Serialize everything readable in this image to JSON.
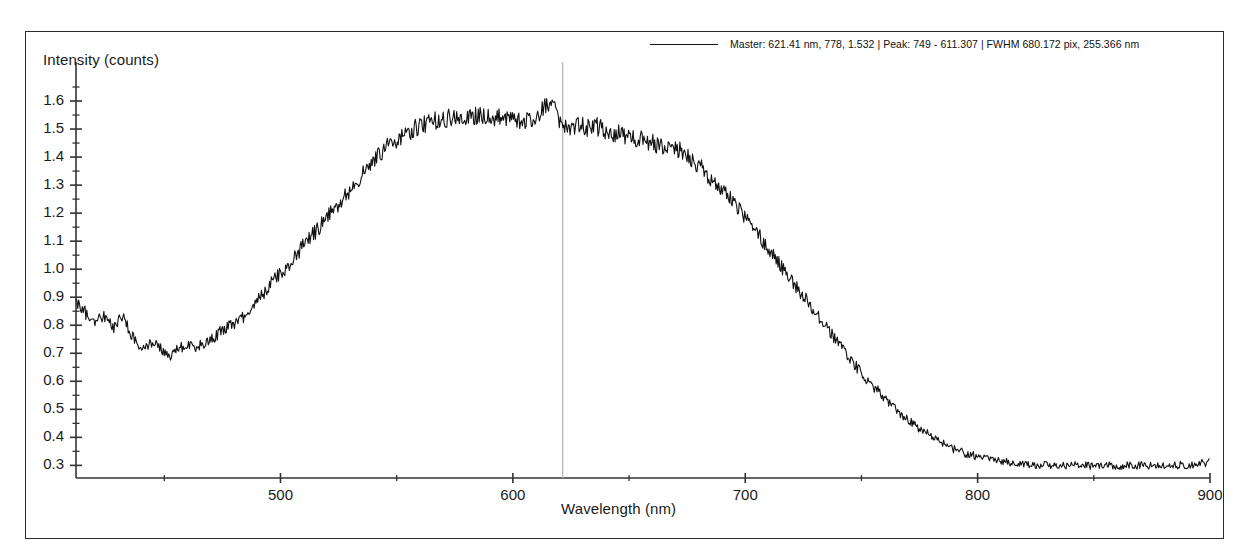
{
  "window": {
    "title": "Spectrometer Trace"
  },
  "legend": {
    "line_sample": "solid-line-sample",
    "label": "Master: 621.41 nm, 778, 1.532 | Peak:  749 - 611.307 | FWHM 680.172 pix, 255.366 nm",
    "master_wavelength_nm": 621.41,
    "master_pixel": 778,
    "master_intensity": 1.532,
    "peak_pixel": 749,
    "peak_value": 611.307,
    "fwhm_pix": 680.172,
    "fwhm_nm": 255.366
  },
  "cursor": {
    "wavelength_nm": 621.41,
    "color": "#b9b9b9"
  },
  "colors": {
    "trace": "#111111",
    "axis": "#333333",
    "frame": "#2b2b2b",
    "background": "#ffffff",
    "text": "#1a1a1a"
  },
  "chart_data": {
    "type": "line",
    "title": "",
    "xlabel": "Wavelength (nm)",
    "ylabel": "Intensity (counts)",
    "xlim": [
      412,
      900
    ],
    "ylim": [
      0.255,
      1.675
    ],
    "grid": false,
    "legend_position": "top-right",
    "x_major_ticks": [
      500,
      600,
      700,
      800,
      900
    ],
    "x_minor_step": 50,
    "y_major_ticks": [
      0.3,
      0.4,
      0.5,
      0.6,
      0.7,
      0.8,
      0.9,
      1.0,
      1.1,
      1.2,
      1.3,
      1.4,
      1.5,
      1.6
    ],
    "y_tick_labels": [
      "0.3",
      "0.4",
      "0.5",
      "0.6",
      "0.7",
      "0.8",
      "0.9",
      "1.0",
      "1.1",
      "1.2",
      "1.3",
      "1.4",
      "1.5",
      "1.6"
    ],
    "y_minor_step": 0.05,
    "annotations": [
      {
        "type": "vline",
        "x": 621.41,
        "label": "master cursor"
      }
    ],
    "series": [
      {
        "name": "Master",
        "noise_amplitude": 0.03,
        "x": [
          412,
          416,
          420,
          424,
          428,
          432,
          436,
          440,
          444,
          448,
          452,
          456,
          460,
          464,
          468,
          472,
          476,
          480,
          484,
          488,
          492,
          496,
          500,
          504,
          508,
          512,
          516,
          520,
          524,
          528,
          532,
          536,
          540,
          544,
          548,
          552,
          556,
          560,
          564,
          568,
          572,
          576,
          580,
          584,
          588,
          592,
          596,
          600,
          604,
          608,
          612,
          616,
          620,
          624,
          628,
          632,
          636,
          640,
          644,
          648,
          652,
          656,
          660,
          664,
          668,
          672,
          676,
          680,
          684,
          688,
          692,
          696,
          700,
          704,
          708,
          712,
          716,
          720,
          724,
          728,
          732,
          736,
          740,
          744,
          748,
          752,
          756,
          760,
          764,
          768,
          772,
          776,
          780,
          784,
          788,
          792,
          796,
          800,
          810,
          820,
          830,
          840,
          850,
          860,
          870,
          880,
          890,
          900
        ],
        "values": [
          0.885,
          0.845,
          0.805,
          0.835,
          0.79,
          0.84,
          0.76,
          0.725,
          0.735,
          0.72,
          0.69,
          0.715,
          0.73,
          0.72,
          0.745,
          0.76,
          0.79,
          0.8,
          0.83,
          0.87,
          0.905,
          0.95,
          0.985,
          1.02,
          1.065,
          1.11,
          1.14,
          1.185,
          1.225,
          1.265,
          1.305,
          1.345,
          1.385,
          1.42,
          1.45,
          1.47,
          1.495,
          1.515,
          1.525,
          1.53,
          1.54,
          1.545,
          1.54,
          1.55,
          1.545,
          1.535,
          1.545,
          1.54,
          1.525,
          1.535,
          1.56,
          1.6,
          1.53,
          1.51,
          1.515,
          1.505,
          1.51,
          1.495,
          1.485,
          1.48,
          1.47,
          1.465,
          1.45,
          1.44,
          1.43,
          1.425,
          1.4,
          1.37,
          1.335,
          1.3,
          1.265,
          1.225,
          1.185,
          1.14,
          1.095,
          1.05,
          1.005,
          0.96,
          0.915,
          0.87,
          0.825,
          0.78,
          0.735,
          0.69,
          0.65,
          0.61,
          0.575,
          0.54,
          0.505,
          0.475,
          0.45,
          0.425,
          0.405,
          0.385,
          0.365,
          0.35,
          0.34,
          0.33,
          0.315,
          0.305,
          0.3,
          0.3,
          0.3,
          0.298,
          0.3,
          0.3,
          0.302,
          0.31
        ]
      }
    ]
  }
}
